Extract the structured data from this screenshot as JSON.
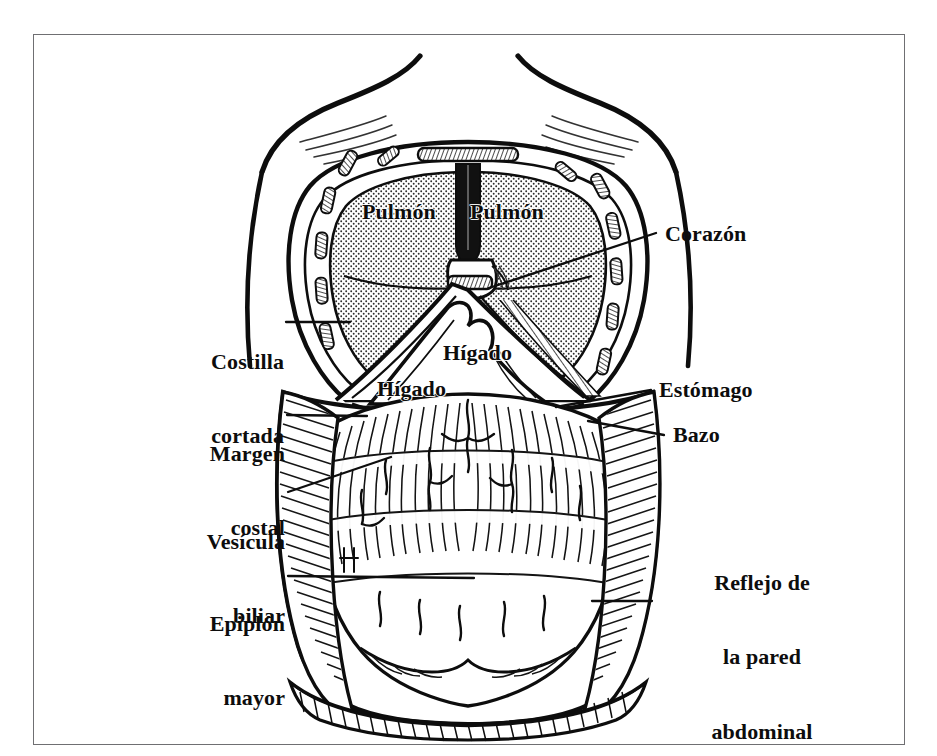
{
  "figure": {
    "language": "es",
    "style": "line-engraving",
    "border_color": "#6f6f72",
    "ink_color": "#0d0d0d",
    "paper_color": "#ffffff",
    "lung_fill_color": "#d8d8d8"
  },
  "labels": [
    {
      "key": "pulmon_izq",
      "text": "Pulmón",
      "lines": [
        "Pulmón"
      ],
      "side": "organ",
      "x": 362,
      "y": 200,
      "size": 22,
      "align": "left"
    },
    {
      "key": "pulmon_der",
      "text": "Pulmón",
      "lines": [
        "Pulmón"
      ],
      "side": "organ",
      "x": 470,
      "y": 200,
      "size": 22,
      "align": "left"
    },
    {
      "key": "corazon",
      "text": "Corazón",
      "lines": [
        "Corazón"
      ],
      "side": "right",
      "x": 665,
      "y": 222,
      "size": 22,
      "align": "left"
    },
    {
      "key": "costilla",
      "text": "Costilla cortada",
      "lines": [
        "Costilla",
        "cortada"
      ],
      "side": "left",
      "x": 184,
      "y": 300,
      "size": 22,
      "align": "right"
    },
    {
      "key": "higado_sup",
      "text": "Hígado",
      "lines": [
        "Hígado"
      ],
      "side": "organ",
      "x": 443,
      "y": 341,
      "size": 22,
      "align": "left"
    },
    {
      "key": "higado_inf",
      "text": "Hígado",
      "lines": [
        "Hígado"
      ],
      "side": "organ",
      "x": 377,
      "y": 377,
      "size": 22,
      "align": "left"
    },
    {
      "key": "estomago",
      "text": "Estómago",
      "lines": [
        "Estómago"
      ],
      "side": "right",
      "x": 659,
      "y": 378,
      "size": 22,
      "align": "left"
    },
    {
      "key": "margen",
      "text": "Margen costal",
      "lines": [
        "Margen",
        "costal"
      ],
      "side": "left",
      "x": 185,
      "y": 392,
      "size": 22,
      "align": "right"
    },
    {
      "key": "bazo",
      "text": "Bazo",
      "lines": [
        "Bazo"
      ],
      "side": "right",
      "x": 673,
      "y": 423,
      "size": 22,
      "align": "left"
    },
    {
      "key": "vesicula",
      "text": "Vesícula biliar",
      "lines": [
        "Vesícula",
        "biliar"
      ],
      "side": "left",
      "x": 185,
      "y": 480,
      "size": 22,
      "align": "right"
    },
    {
      "key": "reflejo",
      "text": "Reflejo de la pared abdominal",
      "lines": [
        "Reflejo de",
        "la pared",
        "abdominal"
      ],
      "side": "right",
      "x": 662,
      "y": 521,
      "size": 22,
      "align": "left"
    },
    {
      "key": "epiplon",
      "text": "Epiplón mayor",
      "lines": [
        "Epiplón",
        "mayor"
      ],
      "side": "left",
      "x": 185,
      "y": 562,
      "size": 22,
      "align": "right"
    }
  ],
  "leader_lines": [
    {
      "key": "corazon",
      "from": [
        656,
        233
      ],
      "to": [
        489,
        288
      ]
    },
    {
      "key": "costilla",
      "from": [
        286,
        322
      ],
      "to": [
        350,
        322
      ]
    },
    {
      "key": "margen",
      "from": [
        287,
        415
      ],
      "to": [
        367,
        416
      ]
    },
    {
      "key": "estomago",
      "from": [
        651,
        390
      ],
      "to": [
        556,
        407
      ]
    },
    {
      "key": "bazo",
      "from": [
        664,
        435
      ],
      "to": [
        588,
        421
      ]
    },
    {
      "key": "vesicula",
      "from": [
        288,
        492
      ],
      "to": [
        391,
        457
      ]
    },
    {
      "key": "epiplon",
      "from": [
        288,
        576
      ],
      "to": [
        474,
        578
      ]
    },
    {
      "key": "reflejo",
      "from": [
        652,
        601
      ],
      "to": [
        592,
        601
      ]
    }
  ],
  "organs": [
    {
      "name": "pulmon-izquierdo",
      "kind": "lung",
      "fill": "stipple"
    },
    {
      "name": "pulmon-derecho",
      "kind": "lung",
      "fill": "stipple"
    },
    {
      "name": "corazon",
      "kind": "heart",
      "fill": "outline"
    },
    {
      "name": "higado",
      "kind": "liver",
      "fill": "outline"
    },
    {
      "name": "estomago",
      "kind": "stomach",
      "fill": "hatch"
    },
    {
      "name": "bazo",
      "kind": "spleen",
      "fill": "hatch"
    },
    {
      "name": "vesicula-biliar",
      "kind": "gallbladder",
      "fill": "outline"
    },
    {
      "name": "epiplon-mayor",
      "kind": "omentum",
      "fill": "hatch"
    },
    {
      "name": "pared-abdominal",
      "kind": "abdominal-wall",
      "fill": "hatch"
    },
    {
      "name": "costillas",
      "kind": "cut-ribs",
      "fill": "hatch"
    },
    {
      "name": "esternon",
      "kind": "sternum",
      "fill": "hatch"
    }
  ]
}
